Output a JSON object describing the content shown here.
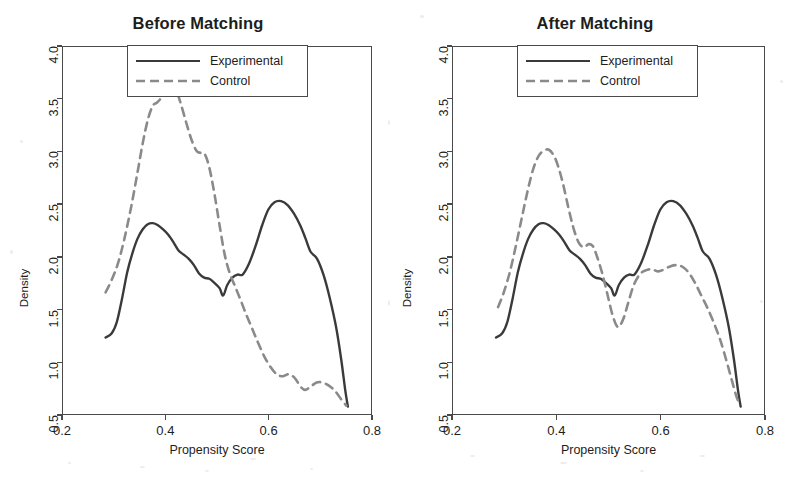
{
  "figure": {
    "background": "#ffffff",
    "experimental_color": "#3a3a3a",
    "control_color": "#8a8a8a",
    "axis_color": "#4a4a4a"
  },
  "legend": {
    "position": "top-center",
    "entries": [
      {
        "label": "Experimental",
        "style": "solid",
        "color": "#3a3a3a"
      },
      {
        "label": "Control",
        "style": "dashed",
        "color": "#8a8a8a"
      }
    ]
  },
  "axes": {
    "xlabel": "Propensity Score",
    "ylabel": "Density",
    "xticks": [
      "0.2",
      "0.4",
      "0.6",
      "0.8"
    ],
    "xtick_values": [
      0.2,
      0.4,
      0.6,
      0.8
    ],
    "yticks": [
      "0.5",
      "1.0",
      "1.5",
      "2.0",
      "2.5",
      "3.0",
      "3.5",
      "4.0"
    ],
    "ytick_values": [
      0.5,
      1.0,
      1.5,
      2.0,
      2.5,
      3.0,
      3.5,
      4.0
    ],
    "xlim": [
      0.2,
      0.8
    ],
    "ylim": [
      0.5,
      4.0
    ],
    "grid": false
  },
  "panels": [
    {
      "id": "before",
      "title": "Before Matching"
    },
    {
      "id": "after",
      "title": "After Matching"
    }
  ],
  "chart_data": [
    {
      "type": "line",
      "title": "Before Matching",
      "xlabel": "Propensity Score",
      "ylabel": "Density",
      "xlim": [
        0.2,
        0.8
      ],
      "ylim": [
        0.5,
        4.0
      ],
      "grid": false,
      "legend_position": "top-center",
      "series": [
        {
          "name": "Experimental",
          "style": "solid",
          "color": "#3a3a3a",
          "x": [
            0.283,
            0.295,
            0.305,
            0.315,
            0.325,
            0.335,
            0.345,
            0.355,
            0.365,
            0.375,
            0.385,
            0.395,
            0.405,
            0.415,
            0.425,
            0.435,
            0.445,
            0.455,
            0.465,
            0.475,
            0.485,
            0.495,
            0.505,
            0.512,
            0.52,
            0.53,
            0.54,
            0.55,
            0.562,
            0.575,
            0.588,
            0.6,
            0.612,
            0.625,
            0.638,
            0.65,
            0.662,
            0.672,
            0.682,
            0.695,
            0.708,
            0.72,
            0.732,
            0.742,
            0.75,
            0.755
          ],
          "y": [
            1.23,
            1.27,
            1.38,
            1.6,
            1.85,
            2.03,
            2.17,
            2.26,
            2.31,
            2.32,
            2.3,
            2.26,
            2.21,
            2.14,
            2.06,
            2.02,
            1.98,
            1.92,
            1.84,
            1.8,
            1.79,
            1.75,
            1.7,
            1.63,
            1.73,
            1.8,
            1.83,
            1.83,
            1.93,
            2.1,
            2.3,
            2.45,
            2.52,
            2.53,
            2.49,
            2.41,
            2.3,
            2.18,
            2.05,
            1.98,
            1.82,
            1.6,
            1.33,
            1.02,
            0.72,
            0.57
          ]
        },
        {
          "name": "Control",
          "style": "dashed",
          "color": "#8a8a8a",
          "x": [
            0.283,
            0.295,
            0.308,
            0.32,
            0.333,
            0.345,
            0.356,
            0.366,
            0.375,
            0.383,
            0.392,
            0.4,
            0.408,
            0.415,
            0.422,
            0.43,
            0.44,
            0.45,
            0.46,
            0.468,
            0.476,
            0.485,
            0.495,
            0.505,
            0.515,
            0.525,
            0.535,
            0.545,
            0.556,
            0.568,
            0.58,
            0.592,
            0.604,
            0.616,
            0.628,
            0.64,
            0.652,
            0.663,
            0.672,
            0.682,
            0.694,
            0.706,
            0.718,
            0.73,
            0.742,
            0.752
          ],
          "y": [
            1.66,
            1.78,
            1.95,
            2.18,
            2.48,
            2.8,
            3.1,
            3.32,
            3.44,
            3.47,
            3.52,
            3.6,
            3.65,
            3.64,
            3.57,
            3.45,
            3.28,
            3.12,
            3.01,
            2.99,
            2.98,
            2.85,
            2.6,
            2.3,
            2.02,
            1.84,
            1.72,
            1.6,
            1.46,
            1.32,
            1.18,
            1.05,
            0.95,
            0.88,
            0.86,
            0.88,
            0.84,
            0.76,
            0.73,
            0.76,
            0.8,
            0.8,
            0.77,
            0.72,
            0.64,
            0.58
          ]
        }
      ]
    },
    {
      "type": "line",
      "title": "After Matching",
      "xlabel": "Propensity Score",
      "ylabel": "Density",
      "xlim": [
        0.2,
        0.8
      ],
      "ylim": [
        0.5,
        4.0
      ],
      "grid": false,
      "legend_position": "top-center",
      "series": [
        {
          "name": "Experimental",
          "style": "solid",
          "color": "#3a3a3a",
          "x": [
            0.283,
            0.295,
            0.305,
            0.315,
            0.325,
            0.335,
            0.345,
            0.355,
            0.365,
            0.375,
            0.385,
            0.395,
            0.405,
            0.415,
            0.425,
            0.435,
            0.445,
            0.455,
            0.465,
            0.475,
            0.485,
            0.495,
            0.505,
            0.512,
            0.52,
            0.53,
            0.54,
            0.55,
            0.562,
            0.575,
            0.588,
            0.6,
            0.612,
            0.625,
            0.638,
            0.65,
            0.662,
            0.672,
            0.682,
            0.695,
            0.708,
            0.72,
            0.732,
            0.742,
            0.75,
            0.755
          ],
          "y": [
            1.23,
            1.27,
            1.38,
            1.6,
            1.85,
            2.03,
            2.17,
            2.26,
            2.31,
            2.32,
            2.3,
            2.26,
            2.21,
            2.14,
            2.06,
            2.02,
            1.98,
            1.92,
            1.84,
            1.8,
            1.79,
            1.75,
            1.7,
            1.63,
            1.73,
            1.8,
            1.83,
            1.83,
            1.93,
            2.1,
            2.3,
            2.45,
            2.52,
            2.53,
            2.49,
            2.41,
            2.3,
            2.18,
            2.05,
            1.98,
            1.82,
            1.6,
            1.33,
            1.02,
            0.72,
            0.57
          ]
        },
        {
          "name": "Control",
          "style": "dashed",
          "color": "#8a8a8a",
          "x": [
            0.287,
            0.298,
            0.31,
            0.322,
            0.334,
            0.345,
            0.355,
            0.365,
            0.375,
            0.385,
            0.395,
            0.403,
            0.412,
            0.422,
            0.432,
            0.442,
            0.452,
            0.462,
            0.47,
            0.478,
            0.488,
            0.498,
            0.508,
            0.518,
            0.528,
            0.538,
            0.548,
            0.56,
            0.572,
            0.584,
            0.596,
            0.608,
            0.62,
            0.632,
            0.644,
            0.656,
            0.668,
            0.68,
            0.692,
            0.704,
            0.716,
            0.728,
            0.738,
            0.746,
            0.752
          ],
          "y": [
            1.52,
            1.66,
            1.86,
            2.12,
            2.4,
            2.65,
            2.84,
            2.96,
            3.01,
            3.02,
            2.96,
            2.86,
            2.7,
            2.48,
            2.28,
            2.14,
            2.09,
            2.12,
            2.1,
            2.0,
            1.84,
            1.64,
            1.44,
            1.33,
            1.4,
            1.56,
            1.72,
            1.83,
            1.87,
            1.88,
            1.86,
            1.88,
            1.91,
            1.92,
            1.9,
            1.84,
            1.74,
            1.62,
            1.5,
            1.36,
            1.2,
            1.0,
            0.82,
            0.68,
            0.6
          ]
        }
      ]
    }
  ]
}
